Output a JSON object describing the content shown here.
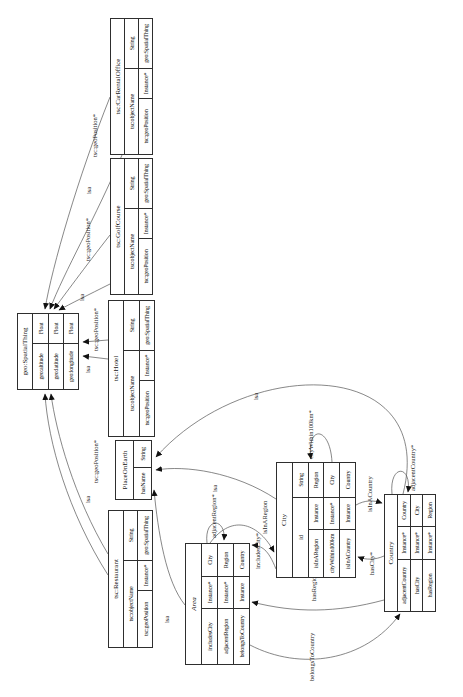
{
  "diagram": {
    "type": "ontology-class-diagram",
    "orientation": "rotated-90-clockwise",
    "accent_color": "#2e2e2e",
    "background_color": "#ffffff",
    "tables": [
      {
        "id": "geo-spatialthing",
        "header": "geo:SpatialThing",
        "italic": false,
        "x": 307,
        "y": 17,
        "w": 77,
        "h": 62,
        "cols": [
          46,
          31
        ],
        "rows": [
          [
            "geo:altitude",
            "Float"
          ],
          [
            "geo:latitude",
            "Float"
          ],
          [
            "geo:longitude",
            "Float"
          ]
        ]
      },
      {
        "id": "tsc-restaurant",
        "header": "tsc:Restaurant",
        "italic": false,
        "x": 49,
        "y": 108,
        "w": 138,
        "h": 45,
        "cols": [
          57,
          30,
          51
        ],
        "rows": [
          [
            "tsc:objectName",
            "String"
          ],
          [
            "tsc:geoPosition",
            "Instance*",
            "geo:SpatialThing"
          ]
        ]
      },
      {
        "id": "placeonearth",
        "header": "PlaceOnEarth",
        "italic": false,
        "x": 197,
        "y": 115,
        "w": 60,
        "h": 37,
        "cols": [
          32,
          28
        ],
        "rows": [
          [
            "hasName",
            "String"
          ]
        ]
      },
      {
        "id": "tsc-hotel",
        "header": "tsc:Hotel",
        "italic": false,
        "x": 260,
        "y": 108,
        "w": 137,
        "h": 47,
        "cols": [
          56,
          30,
          51
        ],
        "rows": [
          [
            "tsc:objectName",
            "String"
          ],
          [
            "tsc:geoPosition",
            "Instance*",
            "geo:SpatialThing"
          ]
        ]
      },
      {
        "id": "tsc-golfcourse",
        "header": "tsc:GolfCourse",
        "italic": false,
        "x": 402,
        "y": 110,
        "w": 137,
        "h": 43,
        "cols": [
          56,
          30,
          51
        ],
        "rows": [
          [
            "tsc:objectName",
            "String"
          ],
          [
            "tsc:geoPosition",
            "Instance*",
            "geo:SpatialThing"
          ]
        ]
      },
      {
        "id": "tsc-carrentaloffice",
        "header": "tsc:CarRentalOffice",
        "italic": false,
        "x": 542,
        "y": 110,
        "w": 137,
        "h": 43,
        "cols": [
          56,
          30,
          51
        ],
        "rows": [
          [
            "tsc:objectName",
            "String"
          ],
          [
            "tsc:geoPosition",
            "Instance*",
            "geo:SpatialThing"
          ]
        ]
      },
      {
        "id": "area",
        "header": "Area",
        "italic": true,
        "x": 32,
        "y": 185,
        "w": 122,
        "h": 65,
        "cols": [
          56,
          32,
          34
        ],
        "rows": [
          [
            "includesCity",
            "Instance*",
            "City"
          ],
          [
            "adjacentRegion",
            "Instance*",
            "Region"
          ],
          [
            "belongsToCountry",
            "Instance",
            "Country"
          ]
        ]
      },
      {
        "id": "city",
        "header": "City",
        "italic": false,
        "x": 119,
        "y": 276,
        "w": 116,
        "h": 80,
        "cols": [
          48,
          32,
          36
        ],
        "rows": [
          [
            "id",
            "String"
          ],
          [
            "isInARegion",
            "Instance",
            "Region"
          ],
          [
            "cityWithin100km",
            "Instance*",
            "City"
          ],
          [
            "isInACountry",
            "Instance",
            "Country"
          ]
        ]
      },
      {
        "id": "country",
        "header": "Country",
        "italic": false,
        "x": 85,
        "y": 384,
        "w": 118,
        "h": 52,
        "cols": [
          52,
          33,
          33
        ],
        "rows": [
          [
            "adjacentCountry",
            "Instance*",
            "Country"
          ],
          [
            "hasCity",
            "Instance*",
            "City"
          ],
          [
            "hasRegion",
            "Instance*",
            "Region"
          ]
        ]
      }
    ],
    "edges": [
      {
        "from": "tsc-carrentaloffice",
        "to": "geo-spatialthing",
        "label": "tsc:geoPosition*",
        "path": "M600,110 C520,78 430,52 388,45",
        "lx": 540,
        "ly": 97
      },
      {
        "from": "tsc-carrentaloffice",
        "to": "geo-spatialthing",
        "label": "isa",
        "path": "M542,122 C480,96 425,64 388,50",
        "lx": 503,
        "ly": 91
      },
      {
        "from": "tsc-golfcourse",
        "to": "geo-spatialthing",
        "label": "tsc:geoPosition*",
        "path": "M462,110 C430,85 400,63 388,54",
        "lx": 436,
        "ly": 90
      },
      {
        "from": "tsc-golfcourse",
        "to": "geo-spatialthing",
        "label": "isa",
        "path": "M413,110 C402,88 393,70 387,59",
        "lx": 396,
        "ly": 84
      },
      {
        "from": "tsc-hotel",
        "to": "geo-spatialthing",
        "label": "isa",
        "path": "M338,108 L341,83",
        "lx": 324,
        "ly": 90
      },
      {
        "from": "tsc-hotel",
        "to": "geo-spatialthing",
        "label": "tsc:geoPosition*",
        "path": "M357,108 L355,83",
        "lx": 346,
        "ly": 98
      },
      {
        "from": "tsc-restaurant",
        "to": "geo-spatialthing",
        "label": "isa",
        "path": "M122,108 C185,68 255,48 303,45",
        "lx": 194,
        "ly": 90
      },
      {
        "from": "tsc-restaurant",
        "to": "geo-spatialthing",
        "label": "tsc:geoPosition*",
        "path": "M143,108 C200,74 265,56 303,51",
        "lx": 214,
        "ly": 98
      },
      {
        "from": "area",
        "to": "placeonearth",
        "label": "isa",
        "path": "M92,185 C115,166 165,158 207,154",
        "lx": 74,
        "ly": 169
      },
      {
        "from": "city",
        "to": "placeonearth",
        "label": "isa",
        "path": "M198,276 C225,235 232,185 227,156",
        "lx": 205,
        "ly": 217
      },
      {
        "from": "country",
        "to": "placeonearth",
        "label": "isa",
        "path": "M203,403 C340,438 343,248 240,156",
        "lx": 297,
        "ly": 258
      },
      {
        "from": "area",
        "to": "city",
        "label": "includesCity*",
        "path": "M154,210 C185,233 172,260 145,274",
        "lx": 128,
        "ly": 260
      },
      {
        "from": "city",
        "to": "area",
        "label": "isInARegion",
        "path": "M128,276 C148,268 151,262 152,252",
        "lx": 163,
        "ly": 267
      },
      {
        "from": "area",
        "to": "area",
        "label": "adjacentRegion*",
        "path": "M154,207 C180,204 180,226 157,224",
        "lx": 159,
        "ly": 216
      },
      {
        "from": "city",
        "to": "city",
        "label": "cityWithin100km*",
        "path": "M235,332 C272,330 272,306 238,311",
        "lx": 238,
        "ly": 313
      },
      {
        "from": "city",
        "to": "country",
        "label": "isInACountry",
        "path": "M192,356 C197,365 197,373 194,382",
        "lx": 185,
        "ly": 372
      },
      {
        "from": "country",
        "to": "city",
        "label": "hasCity*",
        "path": "M141,384 C137,375 137,366 140,358",
        "lx": 122,
        "ly": 374
      },
      {
        "from": "country",
        "to": "area",
        "label": "hasRegion*",
        "path": "M97,384 C84,336 84,295 95,252",
        "lx": 96,
        "ly": 316
      },
      {
        "from": "area",
        "to": "country",
        "label": "belongsToCountry",
        "path": "M52,250 C26,300 35,365 83,400",
        "lx": 16,
        "ly": 314
      },
      {
        "from": "country",
        "to": "country",
        "label": "adjacentCountry*",
        "path": "M203,392 C233,389 233,412 205,408",
        "lx": 206,
        "ly": 415
      }
    ]
  }
}
